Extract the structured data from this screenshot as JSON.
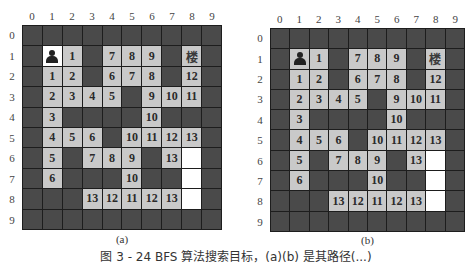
{
  "panels": [
    {
      "id": "a",
      "label": "(a)",
      "start_cell_style": "white",
      "col_labels": [
        "0",
        "1",
        "2",
        "3",
        "4",
        "5",
        "6",
        "7",
        "8",
        "9"
      ],
      "row_labels": [
        "0",
        "1",
        "2",
        "3",
        "4",
        "5",
        "6",
        "7",
        "8",
        "9"
      ]
    },
    {
      "id": "b",
      "label": "(b)",
      "start_cell_style": "grey",
      "col_labels": [
        "0",
        "1",
        "2",
        "3",
        "4",
        "5",
        "6",
        "7",
        "8",
        "9"
      ],
      "row_labels": [
        "0",
        "1",
        "2",
        "3",
        "4",
        "5",
        "6",
        "7",
        "8",
        "9"
      ]
    }
  ],
  "grid": {
    "rows": 10,
    "cols": 10,
    "legend": {
      "W": "wall (dark)",
      "S": "start (person icon)",
      "G": "goal (glyph 楼)",
      "E": "empty open cell (white)",
      "number": "BFS step distance (light grey)"
    },
    "cells": [
      [
        "W",
        "W",
        "W",
        "W",
        "W",
        "W",
        "W",
        "W",
        "W",
        "W"
      ],
      [
        "W",
        "S",
        "1",
        "W",
        "7",
        "8",
        "9",
        "W",
        "G",
        "W"
      ],
      [
        "W",
        "1",
        "2",
        "W",
        "6",
        "7",
        "8",
        "W",
        "12",
        "W"
      ],
      [
        "W",
        "2",
        "3",
        "4",
        "5",
        "W",
        "9",
        "10",
        "11",
        "W"
      ],
      [
        "W",
        "3",
        "W",
        "W",
        "W",
        "W",
        "10",
        "W",
        "W",
        "W"
      ],
      [
        "W",
        "4",
        "5",
        "6",
        "W",
        "10",
        "11",
        "12",
        "13",
        "W"
      ],
      [
        "W",
        "5",
        "W",
        "7",
        "8",
        "9",
        "W",
        "13",
        "E",
        "W"
      ],
      [
        "W",
        "6",
        "W",
        "W",
        "W",
        "10",
        "W",
        "W",
        "E",
        "W"
      ],
      [
        "W",
        "W",
        "W",
        "13",
        "12",
        "11",
        "12",
        "13",
        "E",
        "W"
      ],
      [
        "W",
        "W",
        "W",
        "W",
        "W",
        "W",
        "W",
        "W",
        "W",
        "W"
      ]
    ],
    "goal_glyph": "楼",
    "colors": {
      "wall": "#4a4a4a",
      "grid_line": "#1d1d1d",
      "visited": "#c9c9c9",
      "empty": "#ffffff"
    }
  },
  "caption": "图 3 - 24   BFS 算法搜索目标，(a)(b) 是其路径(...)"
}
